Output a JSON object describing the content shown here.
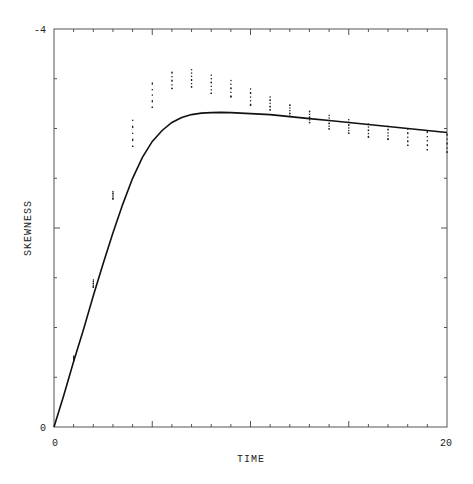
{
  "chart_data": {
    "type": "line",
    "title": "",
    "xlabel": "TIME",
    "ylabel": "SKEWNESS",
    "xlim": [
      0,
      20
    ],
    "ylim": [
      0,
      -4
    ],
    "y_inverted": true,
    "grid": false,
    "legend": null,
    "x_tick_labels": [
      {
        "value": 0,
        "label": "0"
      },
      {
        "value": 20,
        "label": "20"
      }
    ],
    "y_tick_labels": [
      {
        "value": 0,
        "label": "0"
      },
      {
        "value": -4,
        "label": "-4"
      }
    ],
    "x_major_ticks": [
      5,
      10,
      15
    ],
    "x_minor_step": 1,
    "y_tick_step": 0.5,
    "series": [
      {
        "name": "model",
        "kind": "line",
        "x": [
          0,
          0.5,
          1,
          1.5,
          2,
          2.5,
          3,
          3.5,
          4,
          4.5,
          5,
          5.5,
          6,
          6.5,
          7,
          7.5,
          8,
          8.5,
          9,
          10,
          11,
          12,
          13,
          14,
          15,
          16,
          17,
          18,
          19,
          20
        ],
        "y": [
          0,
          -0.32,
          -0.66,
          -0.98,
          -1.32,
          -1.64,
          -1.95,
          -2.24,
          -2.5,
          -2.71,
          -2.87,
          -2.98,
          -3.06,
          -3.11,
          -3.14,
          -3.155,
          -3.16,
          -3.162,
          -3.16,
          -3.15,
          -3.14,
          -3.12,
          -3.1,
          -3.08,
          -3.06,
          -3.04,
          -3.02,
          -3.0,
          -2.98,
          -2.96
        ]
      },
      {
        "name": "samples",
        "kind": "scatter",
        "columns": [
          {
            "x": 1,
            "y_min": -0.68,
            "y_max": -0.72
          },
          {
            "x": 2,
            "y_min": -1.4,
            "y_max": -1.49
          },
          {
            "x": 3,
            "y_min": -2.29,
            "y_max": -2.38
          },
          {
            "x": 4,
            "y_min": -2.8,
            "y_max": -3.12
          },
          {
            "x": 5,
            "y_min": -3.2,
            "y_max": -3.5
          },
          {
            "x": 6,
            "y_min": -3.4,
            "y_max": -3.6
          },
          {
            "x": 7,
            "y_min": -3.42,
            "y_max": -3.6
          },
          {
            "x": 8,
            "y_min": -3.36,
            "y_max": -3.55
          },
          {
            "x": 9,
            "y_min": -3.3,
            "y_max": -3.5
          },
          {
            "x": 10,
            "y_min": -3.22,
            "y_max": -3.42
          },
          {
            "x": 11,
            "y_min": -3.18,
            "y_max": -3.34
          },
          {
            "x": 12,
            "y_min": -3.12,
            "y_max": -3.26
          },
          {
            "x": 13,
            "y_min": -3.06,
            "y_max": -3.2
          },
          {
            "x": 14,
            "y_min": -3.0,
            "y_max": -3.14
          },
          {
            "x": 15,
            "y_min": -2.96,
            "y_max": -3.1
          },
          {
            "x": 16,
            "y_min": -2.9,
            "y_max": -3.06
          },
          {
            "x": 17,
            "y_min": -2.88,
            "y_max": -3.04
          },
          {
            "x": 18,
            "y_min": -2.82,
            "y_max": -3.02
          },
          {
            "x": 19,
            "y_min": -2.78,
            "y_max": -3.0
          },
          {
            "x": 20,
            "y_min": -2.76,
            "y_max": -2.98
          }
        ]
      }
    ]
  },
  "colors": {
    "axis": "#555555",
    "line": "#111111",
    "points": "#222222",
    "background": "#ffffff"
  }
}
